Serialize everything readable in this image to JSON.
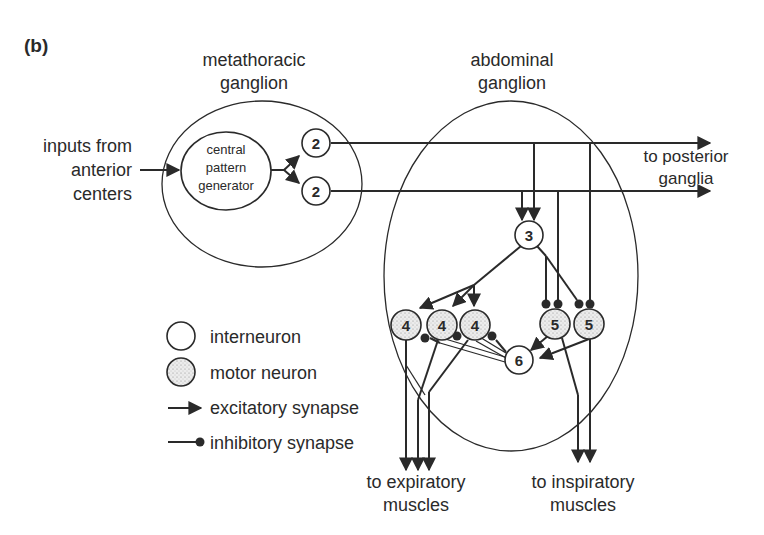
{
  "panel_label": "(b)",
  "ganglia": {
    "metathoracic": {
      "label_line1": "metathoracic",
      "label_line2": "ganglion"
    },
    "abdominal": {
      "label_line1": "abdominal",
      "label_line2": "ganglion"
    }
  },
  "central_pattern_generator": {
    "line1": "central",
    "line2": "pattern",
    "line3": "generator"
  },
  "inputs": {
    "line1": "inputs from",
    "line2": "anterior",
    "line3": "centers"
  },
  "outputs": {
    "posterior": {
      "line1": "to posterior",
      "line2": "ganglia"
    },
    "expiratory": {
      "line1": "to expiratory",
      "line2": "muscles"
    },
    "inspiratory": {
      "line1": "to inspiratory",
      "line2": "muscles"
    }
  },
  "neurons": {
    "n2a": "2",
    "n2b": "2",
    "n3": "3",
    "n4a": "4",
    "n4b": "4",
    "n4c": "4",
    "n5a": "5",
    "n5b": "5",
    "n6": "6"
  },
  "legend": {
    "interneuron": "interneuron",
    "motor_neuron": "motor neuron",
    "excitatory": "excitatory synapse",
    "inhibitory": "inhibitory synapse"
  },
  "colors": {
    "ink": "#2a2a2a",
    "background": "#ffffff"
  }
}
